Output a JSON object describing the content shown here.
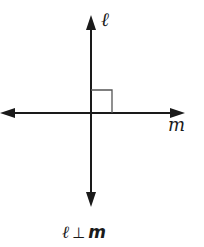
{
  "diagram": {
    "line_vertical_label": "ℓ",
    "line_horizontal_label": "m",
    "caption": {
      "left": "ℓ",
      "symbol": "⊥",
      "right": "m"
    },
    "right_angle_marker": true,
    "colors": {
      "line": "#1a1a1a",
      "marker": "#555555",
      "background": "#ffffff"
    }
  }
}
